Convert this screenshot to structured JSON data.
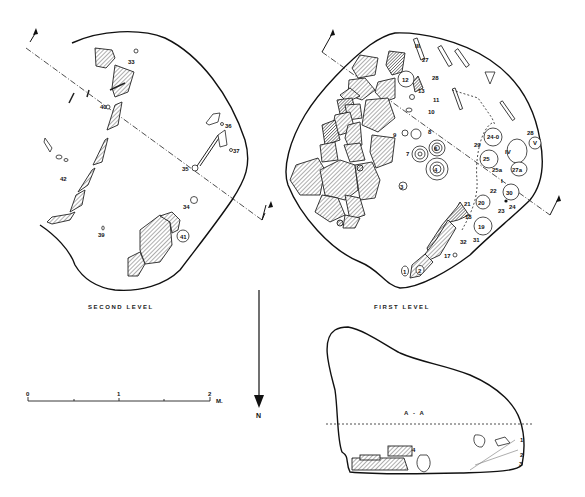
{
  "figure": {
    "captions": {
      "second_level": "SECOND LEVEL",
      "first_level": "FIRST LEVEL",
      "section": "A - A"
    },
    "second_level": {
      "find_labels": [
        "33",
        "40",
        "36",
        "37",
        "35",
        "34",
        "41",
        "42",
        "39"
      ]
    },
    "first_level": {
      "find_labels": [
        "III",
        "27",
        "12",
        "28",
        "13",
        "11",
        "10",
        "9",
        "8",
        "6",
        "7",
        "4",
        "3",
        "24-0",
        "28",
        "V",
        "29",
        "IV",
        "25",
        "25a",
        "27a",
        "I",
        "30",
        "22",
        "20",
        "24",
        "23",
        "21",
        "18",
        "19",
        "32",
        "31",
        "17",
        "1",
        "2"
      ]
    },
    "section_profile": {
      "layer_labels": [
        "1",
        "2",
        "3"
      ],
      "find_label": "4"
    },
    "scale_bar": {
      "ticks": [
        "0",
        "1",
        "2"
      ],
      "unit": "M."
    },
    "north_arrow": {
      "label": "N"
    }
  }
}
